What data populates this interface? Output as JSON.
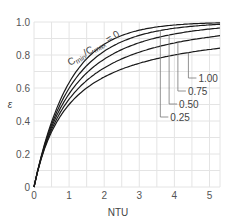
{
  "chart_data": {
    "type": "line",
    "title": "",
    "xlabel": "NTU",
    "ylabel": "ε",
    "xlim": [
      0,
      5.3
    ],
    "ylim": [
      0,
      1.0
    ],
    "xticks": [
      "0",
      "1",
      "2",
      "3",
      "4",
      "5"
    ],
    "yticks": [
      "0",
      "0.2",
      "0.4",
      "0.6",
      "0.8",
      "1.0"
    ],
    "grid": true,
    "parameter_label": "Cmin/Cmax = 0",
    "legend_position": "right, with leader lines",
    "series": [
      {
        "name": "Cmin/Cmax = 0",
        "cr": 0.0,
        "x": [
          0,
          0.5,
          1,
          2,
          3,
          4,
          5,
          5.3
        ],
        "values": [
          0,
          0.39,
          0.63,
          0.86,
          0.95,
          0.98,
          0.99,
          0.995
        ]
      },
      {
        "name": "Cmin/Cmax = 0.25",
        "cr": 0.25,
        "x": [
          0,
          0.5,
          1,
          2,
          3,
          4,
          5,
          5.3
        ],
        "values": [
          0,
          0.38,
          0.6,
          0.82,
          0.92,
          0.96,
          0.98,
          0.985
        ]
      },
      {
        "name": "Cmin/Cmax = 0.50",
        "cr": 0.5,
        "x": [
          0,
          0.5,
          1,
          2,
          3,
          4,
          5,
          5.3
        ],
        "values": [
          0,
          0.37,
          0.57,
          0.77,
          0.87,
          0.92,
          0.95,
          0.955
        ]
      },
      {
        "name": "Cmin/Cmax = 0.75",
        "cr": 0.75,
        "x": [
          0,
          0.5,
          1,
          2,
          3,
          4,
          5,
          5.3
        ],
        "values": [
          0,
          0.36,
          0.54,
          0.71,
          0.79,
          0.84,
          0.87,
          0.88
        ]
      },
      {
        "name": "Cmin/Cmax = 1.00",
        "cr": 1.0,
        "x": [
          0,
          0.5,
          1,
          2,
          3,
          4,
          5,
          5.3
        ],
        "values": [
          0,
          0.33,
          0.5,
          0.67,
          0.75,
          0.8,
          0.83,
          0.84
        ]
      }
    ],
    "annotations": [
      "1.00",
      "0.75",
      "0.50",
      "0.25"
    ]
  },
  "labels": {
    "x_axis": "NTU",
    "y_axis": "ε",
    "curve_family": "Cmin/Cmax = 0",
    "cr_values": [
      "1.00",
      "0.75",
      "0.50",
      "0.25"
    ]
  }
}
